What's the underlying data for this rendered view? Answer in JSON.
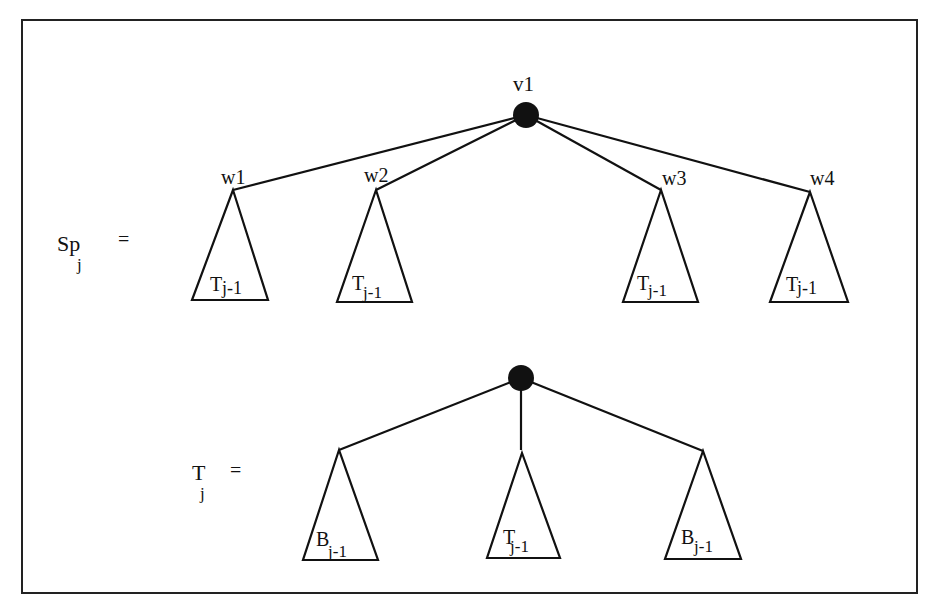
{
  "diagram": {
    "type": "tree-recursion",
    "equations": [
      {
        "lhs": {
          "base": "Sp",
          "sub": "j"
        },
        "equals": "=",
        "root": {
          "label": "v1",
          "fill": "#111111"
        },
        "children": [
          {
            "label": "w1",
            "subtree": {
              "base": "T",
              "sub": "j-1"
            }
          },
          {
            "label": "w2",
            "subtree": {
              "base": "T",
              "sub": "j-1"
            }
          },
          {
            "label": "w3",
            "subtree": {
              "base": "T",
              "sub": "j-1"
            }
          },
          {
            "label": "w4",
            "subtree": {
              "base": "T",
              "sub": "j-1"
            }
          }
        ]
      },
      {
        "lhs": {
          "base": "T",
          "sub": "j"
        },
        "equals": "=",
        "root": {
          "label": "",
          "fill": "#111111"
        },
        "children": [
          {
            "label": "",
            "subtree": {
              "base": "B",
              "sub": "j-1"
            }
          },
          {
            "label": "",
            "subtree": {
              "base": "T",
              "sub": "j-1"
            }
          },
          {
            "label": "",
            "subtree": {
              "base": "B",
              "sub": "j-1"
            }
          }
        ]
      }
    ]
  }
}
